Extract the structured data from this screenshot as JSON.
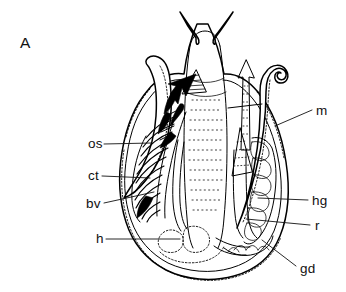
{
  "figure": {
    "panel_letter": "A",
    "caption_present": false,
    "style": "line-drawing",
    "line_color": "#000000",
    "background_color": "#ffffff"
  },
  "labels": {
    "left": [
      {
        "key": "os",
        "text": "os",
        "x": 88,
        "y": 148,
        "leader_to_x": 152,
        "leader_to_y": 145
      },
      {
        "key": "ct",
        "text": "ct",
        "x": 88,
        "y": 180,
        "leader_to_x": 148,
        "leader_to_y": 178
      },
      {
        "key": "bv",
        "text": "bv",
        "x": 86,
        "y": 208,
        "leader_to_x": 152,
        "leader_to_y": 196
      },
      {
        "key": "h",
        "text": "h",
        "x": 96,
        "y": 243,
        "leader_to_x": 178,
        "leader_to_y": 240
      }
    ],
    "right": [
      {
        "key": "m",
        "text": "m",
        "x": 316,
        "y": 115,
        "leader_to_x": 277,
        "leader_to_y": 128
      },
      {
        "key": "hg",
        "text": "hg",
        "x": 312,
        "y": 205,
        "leader_to_x": 262,
        "leader_to_y": 200
      },
      {
        "key": "r",
        "text": "r",
        "x": 315,
        "y": 230,
        "leader_to_x": 250,
        "leader_to_y": 222
      },
      {
        "key": "gd",
        "text": "gd",
        "x": 300,
        "y": 273,
        "leader_to_x": 262,
        "leader_to_y": 240
      }
    ]
  },
  "legend_meanings": {
    "os": "osphradium",
    "ct": "ctenidium",
    "bv": "blood vessel",
    "h": "heart",
    "m": "mantle",
    "hg": "hypobranchial gland",
    "r": "rectum",
    "gd": "gland duct"
  },
  "features": {
    "cephalic_tentacles": 2,
    "mantle_tentacles": 2,
    "flow_arrows": 2,
    "mantle_margin_texture": "beaded"
  }
}
